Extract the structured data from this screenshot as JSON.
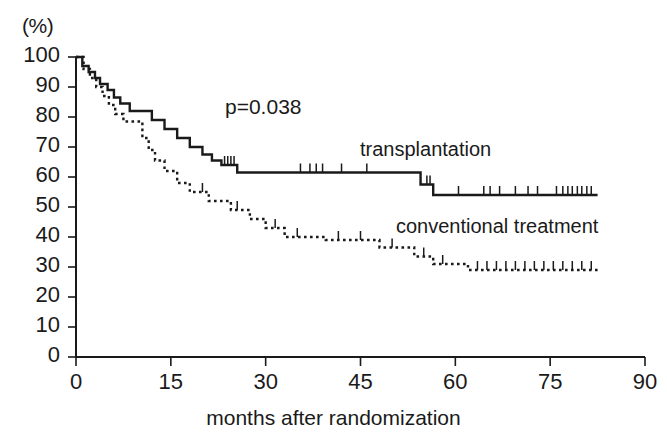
{
  "chart_data": {
    "type": "line",
    "title": "",
    "subtitle": "",
    "xlabel": "months after randomization",
    "ylabel": "(%)",
    "xlim": [
      0,
      90
    ],
    "ylim": [
      0,
      100
    ],
    "xticks": [
      0,
      15,
      30,
      45,
      60,
      75,
      90
    ],
    "xtick_labels": [
      "0",
      "15",
      "30",
      "45",
      "60",
      "75",
      "90"
    ],
    "yticks": [
      0,
      10,
      20,
      30,
      40,
      50,
      60,
      70,
      80,
      90,
      100
    ],
    "ytick_labels": [
      "0",
      "10",
      "20",
      "30",
      "40",
      "50",
      "60",
      "70",
      "80",
      "90",
      "100"
    ],
    "grid": false,
    "legend_position": "inline-annotation",
    "annotations": [
      {
        "text": "p=0.038",
        "x": 33,
        "y": 78
      },
      {
        "text": "transplantation",
        "x": 62,
        "y": 68
      },
      {
        "text": "conventional treatment",
        "x": 62,
        "y": 45
      }
    ],
    "series": [
      {
        "name": "transplantation",
        "style": "solid",
        "color": "#1a1a1a",
        "curve_type": "kaplan-meier-step",
        "points": [
          [
            0,
            100
          ],
          [
            1.0,
            100
          ],
          [
            1.0,
            97
          ],
          [
            2.0,
            97
          ],
          [
            2.0,
            95
          ],
          [
            3.0,
            95
          ],
          [
            3.0,
            93
          ],
          [
            3.8,
            93
          ],
          [
            3.8,
            91
          ],
          [
            5.0,
            91
          ],
          [
            5.0,
            89
          ],
          [
            6.0,
            89
          ],
          [
            6.0,
            86.5
          ],
          [
            7.0,
            86.5
          ],
          [
            7.0,
            84.5
          ],
          [
            8.5,
            84.5
          ],
          [
            8.5,
            82
          ],
          [
            12.0,
            82
          ],
          [
            12.0,
            79
          ],
          [
            14.0,
            79
          ],
          [
            14.0,
            76
          ],
          [
            16.0,
            76
          ],
          [
            16.0,
            73
          ],
          [
            18.0,
            73
          ],
          [
            18.0,
            70
          ],
          [
            20.0,
            70
          ],
          [
            20.0,
            67.5
          ],
          [
            21.5,
            67.5
          ],
          [
            21.5,
            65.5
          ],
          [
            23.0,
            65.5
          ],
          [
            23.0,
            64
          ],
          [
            25.5,
            64
          ],
          [
            25.5,
            61.5
          ],
          [
            54.5,
            61.5
          ],
          [
            54.5,
            57.5
          ],
          [
            56.5,
            57.5
          ],
          [
            56.5,
            54
          ],
          [
            82.5,
            54
          ]
        ],
        "censor_marks": [
          23.5,
          24.0,
          24.5,
          25.0,
          35.5,
          37.0,
          38.0,
          39.0,
          42.0,
          46.0,
          55.5,
          56.0,
          60.5,
          64.5,
          65.5,
          67.0,
          69.5,
          71.5,
          73.0,
          76.0,
          77.0,
          77.8,
          78.5,
          79.3,
          80.0,
          80.8,
          81.5
        ],
        "final_value": 54
      },
      {
        "name": "conventional treatment",
        "style": "dotted",
        "color": "#1a1a1a",
        "curve_type": "kaplan-meier-step",
        "points": [
          [
            0,
            100
          ],
          [
            1.2,
            100
          ],
          [
            1.2,
            96
          ],
          [
            2.2,
            96
          ],
          [
            2.2,
            93
          ],
          [
            3.2,
            93
          ],
          [
            3.2,
            90
          ],
          [
            4.2,
            90
          ],
          [
            4.2,
            87
          ],
          [
            5.2,
            87
          ],
          [
            5.2,
            84
          ],
          [
            6.2,
            84
          ],
          [
            6.2,
            81
          ],
          [
            7.5,
            81
          ],
          [
            7.5,
            78.5
          ],
          [
            10.5,
            78.5
          ],
          [
            10.5,
            73
          ],
          [
            11.5,
            73
          ],
          [
            11.5,
            69
          ],
          [
            12.5,
            69
          ],
          [
            12.5,
            65.5
          ],
          [
            14.0,
            65.5
          ],
          [
            14.0,
            62
          ],
          [
            16.0,
            62
          ],
          [
            16.0,
            58
          ],
          [
            18.0,
            58
          ],
          [
            18.0,
            55
          ],
          [
            21.0,
            55
          ],
          [
            21.0,
            52
          ],
          [
            24.5,
            52
          ],
          [
            24.5,
            49
          ],
          [
            27.5,
            49
          ],
          [
            27.5,
            46
          ],
          [
            30.0,
            46
          ],
          [
            30.0,
            43
          ],
          [
            33.0,
            43
          ],
          [
            33.0,
            40
          ],
          [
            39.5,
            40
          ],
          [
            39.5,
            39
          ],
          [
            48.0,
            39
          ],
          [
            48.0,
            36.5
          ],
          [
            53.5,
            36.5
          ],
          [
            53.5,
            33.5
          ],
          [
            56.5,
            33.5
          ],
          [
            56.5,
            31
          ],
          [
            62.0,
            31
          ],
          [
            62.0,
            29
          ],
          [
            82.5,
            29
          ]
        ],
        "censor_marks": [
          20.0,
          25.5,
          31.5,
          35.0,
          41.5,
          45.0,
          50.0,
          55.0,
          58.0,
          63.5,
          65.0,
          66.5,
          68.0,
          69.5,
          71.0,
          72.5,
          74.0,
          75.5,
          77.0,
          78.5,
          80.0,
          81.5
        ],
        "final_value": 29
      }
    ]
  },
  "axes": {
    "y_unit": "(%)",
    "x_title": "months after randomization"
  },
  "statistics": {
    "p_value_label": "p=0.038"
  },
  "labels": {
    "series_upper": "transplantation",
    "series_lower": "conventional treatment"
  },
  "colors": {
    "ink": "#1a1a1a",
    "background": "#ffffff"
  }
}
